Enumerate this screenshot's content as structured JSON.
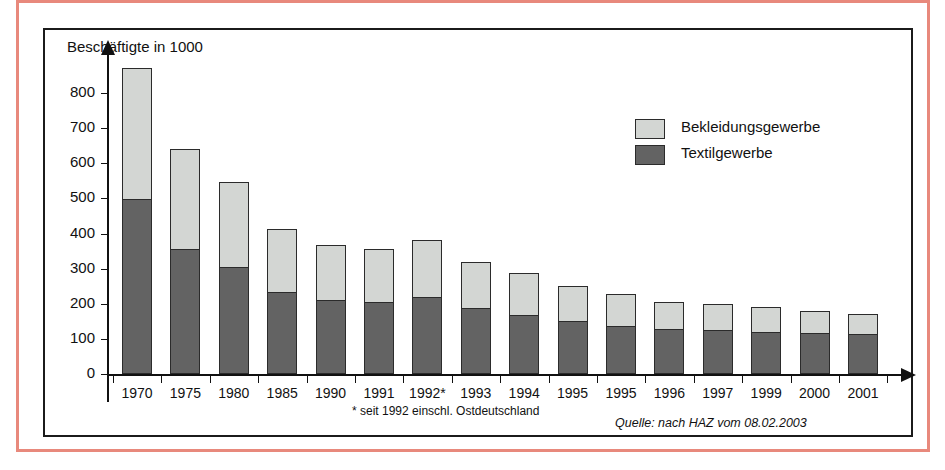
{
  "figure": {
    "y_axis_title": "Beschäftigte in 1000",
    "footnote": "* seit 1992 einschl. Ostdeutschland",
    "source": "Quelle: nach HAZ vom 08.02.2003"
  },
  "legend": {
    "items": [
      {
        "label": "Bekleidungsgewerbe",
        "color": "#d3d6d3"
      },
      {
        "label": "Textilgewerbe",
        "color": "#636363"
      }
    ]
  },
  "chart_data": {
    "type": "bar",
    "stacked": true,
    "title": "",
    "xlabel": "",
    "ylabel": "Beschäftigte in 1000",
    "ylim": [
      0,
      870
    ],
    "yticks": [
      0,
      100,
      200,
      300,
      400,
      500,
      600,
      700,
      800
    ],
    "ytick_labels": [
      "0",
      "100",
      "200",
      "300",
      "400",
      "500",
      "600",
      "700",
      "800"
    ],
    "grid": false,
    "legend_position": "upper-right",
    "categories": [
      "1970",
      "1975",
      "1980",
      "1985",
      "1990",
      "1991",
      "1992*",
      "1993",
      "1994",
      "1995",
      "1995",
      "1996",
      "1997",
      "1999",
      "2000",
      "2001"
    ],
    "series": [
      {
        "name": "Textilgewerbe",
        "color": "#636363",
        "values": [
          495,
          352,
          302,
          230,
          208,
          202,
          217,
          185,
          165,
          148,
          135,
          125,
          122,
          117,
          113,
          110
        ]
      },
      {
        "name": "Bekleidungsgewerbe",
        "color": "#d3d6d3",
        "values": [
          375,
          288,
          246,
          182,
          160,
          155,
          165,
          135,
          123,
          102,
          93,
          80,
          78,
          73,
          65,
          60
        ]
      }
    ],
    "totals": [
      870,
      640,
      548,
      412,
      368,
      357,
      382,
      320,
      288,
      250,
      228,
      205,
      200,
      190,
      178,
      170
    ],
    "annotations": [
      "* seit 1992 einschl. Ostdeutschland",
      "Quelle: nach HAZ vom 08.02.2003"
    ]
  }
}
